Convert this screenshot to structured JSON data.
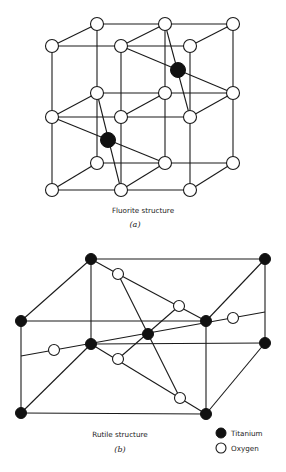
{
  "figure_a": {
    "caption": "Fluorite structure",
    "label": "(a)"
  },
  "figure_b": {
    "caption": "Rutile structure",
    "label": "(b)"
  },
  "legend": {
    "items": [
      {
        "label": "Titanium",
        "marker": "filled-black-circle"
      },
      {
        "label": "Oxygen",
        "marker": "hollow-white-circle"
      }
    ]
  },
  "colors": {
    "line": "#1a1a1a",
    "atom_dark": "#111111",
    "atom_light": "#ffffff",
    "background": "#ffffff"
  }
}
